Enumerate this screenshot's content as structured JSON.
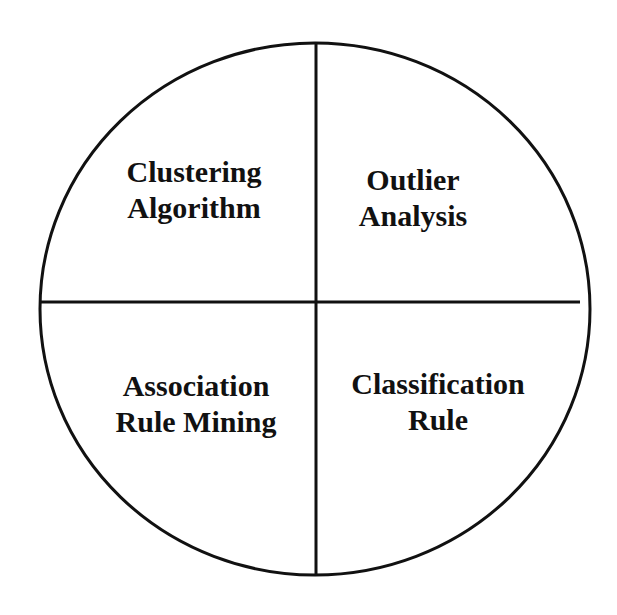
{
  "diagram": {
    "type": "quadrant-circle",
    "colors": {
      "stroke": "#111111",
      "background": "#ffffff",
      "text": "#111111"
    },
    "quadrants": [
      {
        "position": "top-left",
        "line1": "Clustering",
        "line2": "Algorithm"
      },
      {
        "position": "top-right",
        "line1": "Outlier",
        "line2": "Analysis"
      },
      {
        "position": "bottom-left",
        "line1": "Association",
        "line2": "Rule Mining"
      },
      {
        "position": "bottom-right",
        "line1": "Classification",
        "line2": "Rule"
      }
    ]
  }
}
